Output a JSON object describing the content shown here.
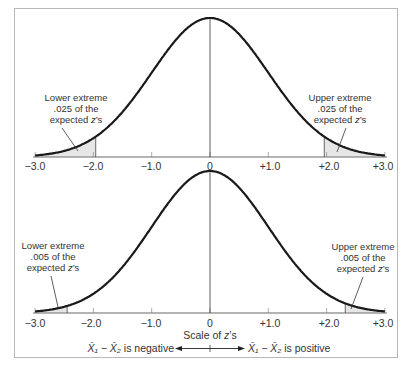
{
  "chart_data": [
    {
      "type": "area",
      "title": "",
      "description": "Standard normal curve with two-tailed .05 rejection regions",
      "xlabel": "",
      "ylabel": "",
      "xlim": [
        -3.0,
        3.0
      ],
      "x_ticks": [
        "-3.0",
        "-2.0",
        "-1.0",
        "0",
        "+1.0",
        "+2.0",
        "+3.0"
      ],
      "x_tick_values": [
        -3,
        -2,
        -1,
        0,
        1,
        2,
        3
      ],
      "critical_values": [
        -1.96,
        1.96
      ],
      "shaded_regions": [
        [
          -3.0,
          -1.96
        ],
        [
          1.96,
          3.0
        ]
      ],
      "annotations": [
        {
          "side": "lower",
          "lines": [
            "Lower extreme",
            ".025 of the",
            "expected z's"
          ]
        },
        {
          "side": "upper",
          "lines": [
            "Upper extreme",
            ".025 of the",
            "expected z's"
          ]
        }
      ],
      "grid": false
    },
    {
      "type": "area",
      "title": "",
      "description": "Standard normal curve with two-tailed .01 rejection regions",
      "xlabel": "Scale of z's",
      "ylabel": "",
      "xlim": [
        -3.0,
        3.0
      ],
      "x_ticks": [
        "-3.0",
        "-2.0",
        "-1.0",
        "0",
        "+1.0",
        "+2.0",
        "+3.0"
      ],
      "x_tick_values": [
        -3,
        -2,
        -1,
        0,
        1,
        2,
        3
      ],
      "critical_values": [
        -2.58,
        2.58
      ],
      "shaded_regions": [
        [
          -3.0,
          -2.58
        ],
        [
          2.58,
          3.0
        ]
      ],
      "annotations": [
        {
          "side": "lower",
          "lines": [
            "Lower extreme",
            ".005 of the",
            "expected z's"
          ]
        },
        {
          "side": "upper",
          "lines": [
            "Upper extreme",
            ".005 of the",
            "expected z's"
          ]
        }
      ],
      "grid": false
    }
  ],
  "top": {
    "ticks": [
      "−3.0",
      "−2.0",
      "−1.0",
      "0",
      "+1.0",
      "+2.0",
      "+3.0"
    ],
    "lower_ann": [
      "Lower extreme",
      ".025 of the",
      "expected "
    ],
    "upper_ann": [
      "Upper extreme",
      ".025 of the",
      "expected "
    ],
    "z_label": "z",
    "z_suffix": "’s"
  },
  "bottom": {
    "ticks": [
      "−3.0",
      "−2.0",
      "−1.0",
      "0",
      "+1.0",
      "+2.0",
      "+3.0"
    ],
    "lower_ann": [
      "Lower extreme",
      ".005 of the",
      "expected "
    ],
    "upper_ann": [
      "Upper extreme",
      ".005 of the",
      "expected "
    ],
    "z_label": "z",
    "z_suffix": "’s"
  },
  "caption": {
    "scale_prefix": "Scale of ",
    "scale_z": "z",
    "scale_suffix": "’s",
    "negative": "is negative",
    "positive": "is positive",
    "diff_symbol": "X̄₁ − X̄₂"
  },
  "colors": {
    "curve": "#1a1a1a",
    "axis": "#9a9a9a",
    "shade": "#e6e6e6",
    "frame": "#b8b8b8"
  }
}
